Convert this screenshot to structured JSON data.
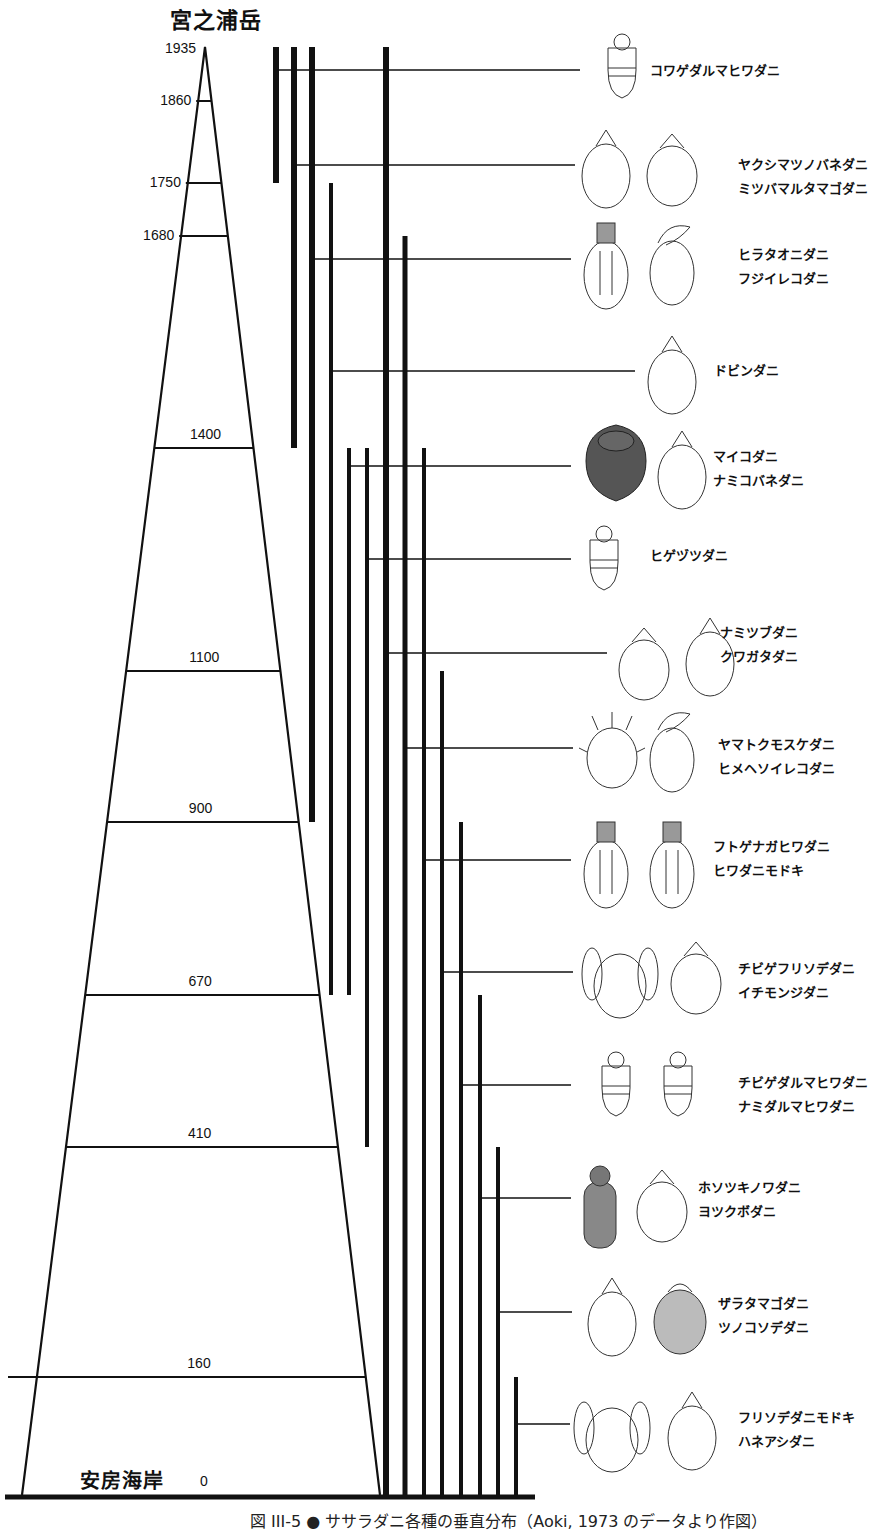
{
  "figure": {
    "summit_name": "宮之浦岳",
    "base_name": "安房海岸",
    "caption": "図 III-5 ● ササラダニ各種の垂直分布（Aoki, 1973 のデータより作図）",
    "line_color": "#111111",
    "background": "#ffffff"
  },
  "chart_data": {
    "type": "range-diagram",
    "title": "",
    "ylabel": "標高 (m)",
    "ylim": [
      0,
      1935
    ],
    "summit": {
      "label": "宮之浦岳",
      "altitude": 1935
    },
    "base": {
      "label": "安房海岸",
      "altitude": 0
    },
    "altitude_levels": [
      1935,
      1860,
      1750,
      1680,
      1400,
      1100,
      900,
      670,
      410,
      160,
      0
    ],
    "altitude_labels": [
      "1935",
      "1860",
      "1750",
      "1680",
      "1400",
      "1100",
      "900",
      "670",
      "410",
      "160",
      "0"
    ],
    "ranges": [
      {
        "species": [
          "コワゲダルマヒワダニ"
        ],
        "top": 1935,
        "bottom": 1750
      },
      {
        "species": [
          "ヤクシマツノバネダニ",
          "ミツバマルタマゴダニ"
        ],
        "top": 1935,
        "bottom": 1400
      },
      {
        "species": [
          "ヒラタオニダニ",
          "フジイレコダニ"
        ],
        "top": 1935,
        "bottom": 900
      },
      {
        "species": [
          "ドビンダニ"
        ],
        "top": 1750,
        "bottom": 670
      },
      {
        "species": [
          "マイコダニ",
          "ナミコバネダニ"
        ],
        "top": 1400,
        "bottom": 670
      },
      {
        "species": [
          "ヒゲヅツダニ"
        ],
        "top": 1400,
        "bottom": 410
      },
      {
        "species": [
          "ナミツブダニ",
          "クワガタダニ"
        ],
        "top": 1935,
        "bottom": 0
      },
      {
        "species": [
          "ヤマトクモスケダニ",
          "ヒメヘソイレコダニ"
        ],
        "top": 1680,
        "bottom": 0
      },
      {
        "species": [
          "フトゲナガヒワダニ",
          "ヒワダニモドキ"
        ],
        "top": 1400,
        "bottom": 0
      },
      {
        "species": [
          "チビゲフリソデダニ",
          "イチモンジダニ"
        ],
        "top": 1100,
        "bottom": 0
      },
      {
        "species": [
          "チビゲダルマヒワダニ",
          "ナミダルマヒワダニ"
        ],
        "top": 900,
        "bottom": 0
      },
      {
        "species": [
          "ホソツキノワダニ",
          "ヨツクボダニ"
        ],
        "top": 670,
        "bottom": 0
      },
      {
        "species": [
          "ザラタマゴダニ",
          "ツノコソデダニ"
        ],
        "top": 410,
        "bottom": 0
      },
      {
        "species": [
          "フリソデダニモドキ",
          "ハネアシダニ"
        ],
        "top": 160,
        "bottom": 0
      }
    ]
  }
}
